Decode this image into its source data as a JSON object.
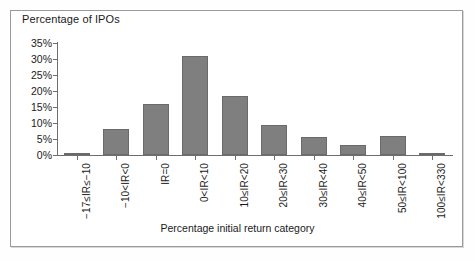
{
  "figure": {
    "background_color": "#ffffff",
    "frame_color": "#9a9a9a",
    "bar_color": "#7f7f7f",
    "axis_color": "#6e6e6e",
    "text_color": "#1a1a1a"
  },
  "chart_data": {
    "type": "bar",
    "title": "",
    "ylabel": "Percentage of IPOs",
    "xlabel": "Percentage initial return category",
    "ylim": [
      0,
      35
    ],
    "ytick_labels": [
      "0%",
      "5%",
      "10%",
      "15%",
      "20%",
      "25%",
      "30%",
      "35%"
    ],
    "ytick_values": [
      0,
      5,
      10,
      15,
      20,
      25,
      30,
      35
    ],
    "grid": false,
    "legend": "none",
    "categories": [
      "−17≤IR≤−10",
      "−10<IR<0",
      "IR=0",
      "0<IR<10",
      "10≤IR<20",
      "20≤IR<30",
      "30≤IR<40",
      "40≤IR<50",
      "50≤IR<100",
      "100≤IR<330"
    ],
    "values": [
      0.7,
      8.0,
      16.0,
      31.0,
      18.5,
      9.5,
      5.5,
      3.0,
      6.0,
      0.7
    ]
  }
}
